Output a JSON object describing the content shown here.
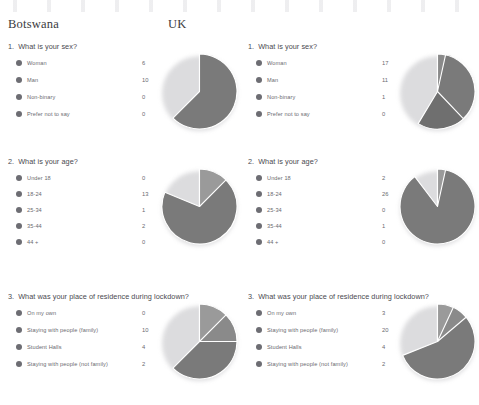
{
  "colors": {
    "slice_dark": "#6f6f75",
    "slice_mid": "#7a7a80",
    "slice_light": "#8a8a90",
    "slice_pale": "#9a9aa0",
    "gap": "#ffffff",
    "text": "#6a6a70",
    "heading": "#3b3b40"
  },
  "headers": {
    "left_country": "Botswana",
    "right_country": "UK"
  },
  "questions": [
    {
      "number": "1.",
      "text": "What is your sex?",
      "options": [
        "Woman",
        "Man",
        "Non-binary",
        "Prefer not to say"
      ]
    },
    {
      "number": "2.",
      "text": "What is your age?",
      "options": [
        "Under 18",
        "18-24",
        "25-34",
        "35-44",
        "44 +"
      ]
    },
    {
      "number": "3.",
      "text": "What was your place of residence during lockdown?",
      "options": [
        "On my own",
        "Staying with people (family)",
        "Student Halls",
        "Staying with people (not family)"
      ]
    }
  ],
  "chart_data": [
    {
      "type": "pie",
      "title": "What is your sex?",
      "country": "Botswana",
      "question_number": 1,
      "categories": [
        "Woman",
        "Man",
        "Non-binary",
        "Prefer not to say"
      ],
      "values": [
        6,
        10,
        0,
        0
      ],
      "total": 16,
      "legend": "left"
    },
    {
      "type": "pie",
      "title": "What is your sex?",
      "country": "UK",
      "question_number": 1,
      "categories": [
        "Woman",
        "Man",
        "Non-binary",
        "Prefer not to say"
      ],
      "values": [
        17,
        11,
        1,
        0
      ],
      "total": 29,
      "legend": "left"
    },
    {
      "type": "pie",
      "title": "What is your age?",
      "country": "Botswana",
      "question_number": 2,
      "categories": [
        "Under 18",
        "18-24",
        "25-34",
        "35-44",
        "44 +"
      ],
      "values": [
        0,
        13,
        1,
        2,
        0
      ],
      "total": 16,
      "legend": "left"
    },
    {
      "type": "pie",
      "title": "What is your age?",
      "country": "UK",
      "question_number": 2,
      "categories": [
        "Under 18",
        "18-24",
        "25-34",
        "35-44",
        "44 +"
      ],
      "values": [
        2,
        26,
        0,
        1,
        0
      ],
      "total": 29,
      "legend": "left"
    },
    {
      "type": "pie",
      "title": "What was your place of residence during lockdown?",
      "country": "Botswana",
      "question_number": 3,
      "categories": [
        "On my own",
        "Staying with people (family)",
        "Student Halls",
        "Staying with people (not family)"
      ],
      "values": [
        0,
        10,
        4,
        2
      ],
      "total": 16,
      "legend": "left"
    },
    {
      "type": "pie",
      "title": "What was your place of residence during lockdown?",
      "country": "UK",
      "question_number": 3,
      "categories": [
        "On my own",
        "Staying with people (family)",
        "Student Halls",
        "Staying with people (not family)"
      ],
      "values": [
        3,
        20,
        4,
        2
      ],
      "total": 29,
      "legend": "left"
    }
  ]
}
